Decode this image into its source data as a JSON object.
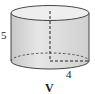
{
  "diagram": {
    "shape": "cylinder",
    "labels": {
      "height": "5",
      "radius": "4",
      "caption": "V"
    },
    "colors": {
      "side_fill": "#dcdcdc",
      "top_fill": "#ececec",
      "stroke": "#333333"
    }
  }
}
